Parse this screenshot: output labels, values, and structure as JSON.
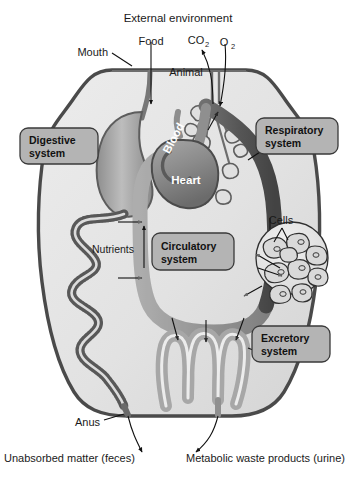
{
  "figure": {
    "title": "External environment",
    "subject_label": "Animal",
    "type": "anatomical-schematic",
    "colors": {
      "background": "#ffffff",
      "body_fill": "#e3e3e3",
      "body_outline": "#4a4a4a",
      "organ_fill_light": "#d2d2d2",
      "organ_fill_mid": "#a9a9a9",
      "organ_fill_dark": "#6e6e6e",
      "vessel_dark": "#5d5d5d",
      "vessel_light": "#a6a6a6",
      "label_box_fill": "#b4b4b4",
      "label_box_border": "#3a3a3a",
      "text": "#1a1a1a",
      "text_on_organ": "#ffffff",
      "arrow": "#111111"
    }
  },
  "top_labels": {
    "external_environment": "External environment",
    "mouth": "Mouth",
    "food": "Food",
    "co2_main": "CO",
    "co2_sub": "2",
    "o2_main": "O",
    "o2_sub": "2",
    "animal": "Animal"
  },
  "system_boxes": [
    {
      "id": "digestive",
      "line1": "Digestive",
      "line2": "system"
    },
    {
      "id": "respiratory",
      "line1": "Respiratory",
      "line2": "system"
    },
    {
      "id": "circulatory",
      "line1": "Circulatory",
      "line2": "system"
    },
    {
      "id": "excretory",
      "line1": "Excretory",
      "line2": "system"
    }
  ],
  "inner_labels": {
    "blood": "Blood",
    "heart": "Heart",
    "nutrients": "Nutrients",
    "cells": "Cells"
  },
  "bottom_labels": {
    "anus": "Anus",
    "feces": "Unabsorbed matter (feces)",
    "urine": "Metabolic waste products (urine)"
  }
}
